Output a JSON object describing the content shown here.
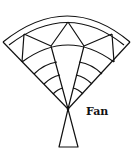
{
  "diagram": {
    "label": "Fan",
    "stroke_color": "#111111",
    "background": "#ffffff"
  }
}
